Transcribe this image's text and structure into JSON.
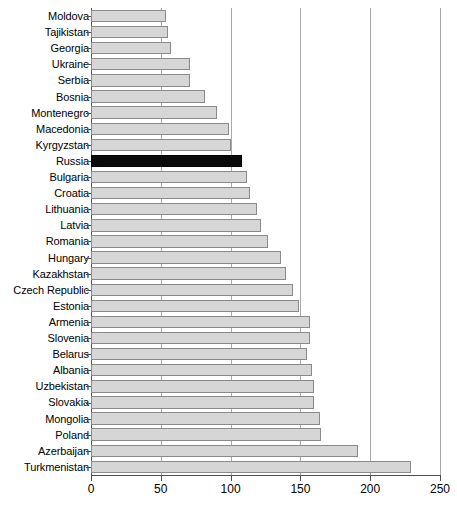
{
  "chart_data": {
    "type": "bar",
    "orientation": "horizontal",
    "title": "",
    "subtitle": "",
    "xlabel": "",
    "ylabel": "",
    "xlim": [
      0,
      250
    ],
    "xticks": [
      0,
      50,
      100,
      150,
      200,
      250
    ],
    "grid": "vertical",
    "legend": "none",
    "highlight_category": "Russia",
    "colors": {
      "bar_fill": "#d6d6d6",
      "bar_border": "#8a8a8a",
      "highlight_fill": "#0b0b0b",
      "gridline": "#a9a9a9",
      "axis": "#4d4d4d",
      "text": "#000000",
      "background": "#ffffff"
    },
    "categories": [
      "Moldova",
      "Tajikistan",
      "Georgia",
      "Ukraine",
      "Serbia",
      "Bosnia",
      "Montenegro",
      "Macedonia",
      "Kyrgyzstan",
      "Russia",
      "Bulgaria",
      "Croatia",
      "Lithuania",
      "Latvia",
      "Romania",
      "Hungary",
      "Kazakhstan",
      "Czech Republic",
      "Estonia",
      "Armenia",
      "Slovenia",
      "Belarus",
      "Albania",
      "Uzbekistan",
      "Slovakia",
      "Mongolia",
      "Poland",
      "Azerbaijan",
      "Turkmenistan"
    ],
    "values": [
      54,
      55,
      57,
      71,
      71,
      82,
      90,
      99,
      100,
      108,
      112,
      114,
      119,
      122,
      127,
      136,
      140,
      145,
      149,
      157,
      157,
      155,
      158,
      160,
      160,
      164,
      165,
      191,
      229
    ]
  }
}
